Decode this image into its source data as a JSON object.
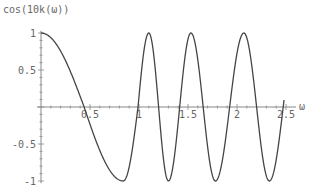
{
  "chart_data": {
    "type": "line",
    "title": "cos(10k(ω))",
    "xlabel": "ω",
    "ylabel": "cos(10k(ω))",
    "xlim": [
      0,
      2.55
    ],
    "ylim": [
      -1,
      1
    ],
    "grid": false,
    "legend": null,
    "x_ticks": [
      0.5,
      1,
      1.5,
      2,
      2.5
    ],
    "x_tick_labels": [
      "0.5",
      "1",
      "1.5",
      "2",
      "2.5"
    ],
    "y_ticks": [
      1,
      0.5,
      -0.5,
      -1
    ],
    "y_tick_labels": [
      "1",
      "0.5",
      "-0.5",
      "-1"
    ],
    "series": [
      {
        "name": "cos(10k(ω))",
        "color": "#444444",
        "key_points": [
          {
            "x": 0.0,
            "y": 1
          },
          {
            "x": 0.44,
            "y": 0
          },
          {
            "x": 0.84,
            "y": -1
          },
          {
            "x": 0.99,
            "y": 0
          },
          {
            "x": 1.1,
            "y": 1
          },
          {
            "x": 1.3,
            "y": -1
          },
          {
            "x": 1.53,
            "y": 1
          },
          {
            "x": 1.78,
            "y": -1
          },
          {
            "x": 2.07,
            "y": 1
          },
          {
            "x": 2.33,
            "y": -1
          },
          {
            "x": 2.48,
            "y": 0.1
          }
        ],
        "phase_anchors": [
          [
            0.0,
            0
          ],
          [
            0.44,
            0.5
          ],
          [
            0.84,
            1
          ],
          [
            0.99,
            1.5
          ],
          [
            1.1,
            2
          ],
          [
            1.3,
            3
          ],
          [
            1.53,
            4
          ],
          [
            1.78,
            5
          ],
          [
            2.07,
            6
          ],
          [
            2.33,
            7
          ],
          [
            2.48,
            7.53
          ]
        ]
      }
    ]
  },
  "axis_color": "#888888"
}
